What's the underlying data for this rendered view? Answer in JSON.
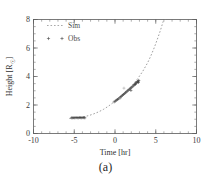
{
  "figure": {
    "caption": "(a)",
    "background": "#ffffff"
  },
  "chart_data": {
    "type": "scatter",
    "title": "",
    "xlabel": "Time [hr]",
    "ylabel": "Height [R☉]",
    "ylabel_main": "Height [R",
    "ylabel_sub": "☉",
    "ylabel_end": "]",
    "xlim": [
      -10,
      10
    ],
    "ylim": [
      0,
      8
    ],
    "xticks": [
      -10,
      -5,
      0,
      5,
      10
    ],
    "xticklabels": [
      "-10",
      "-5",
      "0",
      "5",
      "10"
    ],
    "yticks": [
      0,
      2,
      4,
      6,
      8
    ],
    "yticklabels": [
      "0",
      "2",
      "4",
      "6",
      "8"
    ],
    "x_minor_interval": 1,
    "y_minor_interval": 0.5,
    "grid": false,
    "legend_position": "upper-left",
    "legend": [
      {
        "name": "Sim",
        "marker": "dashed-line",
        "color": "#8e8e8e"
      },
      {
        "name": "Obs",
        "marker": "plus",
        "color": "#3c3c3c"
      }
    ],
    "series": [
      {
        "name": "Sim",
        "style": "dashed",
        "color": "#8e8e8e",
        "x": [
          -5.6,
          -5.0,
          -4.4,
          -3.8,
          -3.2,
          -2.6,
          -2.0,
          -1.4,
          -0.8,
          -0.2,
          0.4,
          1.0,
          1.6,
          2.2,
          2.8,
          3.4,
          4.0,
          4.4,
          4.8,
          5.2,
          5.6,
          5.9,
          6.15
        ],
        "y": [
          1.05,
          1.08,
          1.12,
          1.18,
          1.26,
          1.38,
          1.52,
          1.7,
          1.92,
          2.18,
          2.46,
          2.76,
          3.08,
          3.44,
          3.86,
          4.36,
          4.96,
          5.45,
          6.0,
          6.62,
          7.28,
          7.85,
          8.0
        ]
      },
      {
        "name": "Obs",
        "style": "plus",
        "color": "#3c3c3c",
        "x": [
          -5.35,
          -5.2,
          -5.05,
          -4.92,
          -4.78,
          -4.64,
          -4.5,
          -4.36,
          -4.22,
          -4.08,
          -3.94,
          -3.82,
          -3.7,
          -0.1,
          0.05,
          0.18,
          0.3,
          0.42,
          0.55,
          0.68,
          0.8,
          0.92,
          1.04,
          1.16,
          1.28,
          1.4,
          1.52,
          1.64,
          1.76,
          1.88,
          2.0,
          2.12,
          2.24,
          2.34,
          2.44,
          2.54,
          2.62,
          2.7,
          2.78,
          2.85,
          2.92,
          0.62,
          1.1,
          1.95,
          2.48,
          2.88
        ],
        "y": [
          1.1,
          1.1,
          1.11,
          1.1,
          1.12,
          1.11,
          1.1,
          1.12,
          1.11,
          1.1,
          1.12,
          1.11,
          1.1,
          2.22,
          2.28,
          2.34,
          2.38,
          2.44,
          2.5,
          2.56,
          2.62,
          2.68,
          2.74,
          2.8,
          2.86,
          2.92,
          2.98,
          3.04,
          3.1,
          3.16,
          3.22,
          3.28,
          3.34,
          3.4,
          3.46,
          3.52,
          3.56,
          3.6,
          3.64,
          3.68,
          3.72,
          2.46,
          3.18,
          3.02,
          3.44,
          3.58
        ],
        "outliers": [
          {
            "x": 1.1,
            "y": 3.18
          },
          {
            "x": 0.62,
            "y": 2.46
          }
        ]
      }
    ],
    "annotations": []
  }
}
